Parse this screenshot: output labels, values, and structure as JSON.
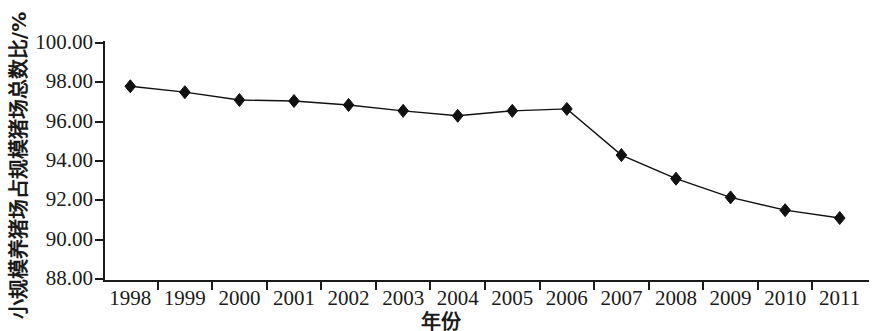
{
  "chart_data": {
    "type": "line",
    "title": "",
    "xlabel": "年份",
    "ylabel": "小规模养猪场占规模猪场总数比/%",
    "categories": [
      "1998",
      "1999",
      "2000",
      "2001",
      "2002",
      "2003",
      "2004",
      "2005",
      "2006",
      "2007",
      "2008",
      "2009",
      "2010",
      "2011"
    ],
    "values": [
      97.8,
      97.5,
      97.1,
      97.05,
      96.85,
      96.55,
      96.3,
      96.55,
      96.65,
      94.3,
      93.1,
      92.15,
      91.5,
      91.1
    ],
    "series": [
      {
        "name": "小规模养猪场占规模猪场总数比",
        "values": [
          97.8,
          97.5,
          97.1,
          97.05,
          96.85,
          96.55,
          96.3,
          96.55,
          96.65,
          94.3,
          93.1,
          92.15,
          91.5,
          91.1
        ],
        "color": "#111111",
        "marker": "diamond",
        "line_style": "solid"
      }
    ],
    "ylim": [
      88.0,
      100.0
    ],
    "ytick_step": 2.0,
    "ytick_labels": [
      "100.00",
      "98.00",
      "96.00",
      "94.00",
      "92.00",
      "90.00",
      "88.00"
    ],
    "ytick_values": [
      100.0,
      98.0,
      96.0,
      94.0,
      92.0,
      90.0,
      88.0
    ],
    "grid": false,
    "legend": "none",
    "background_color": "#ffffff",
    "axis_color": "#1a1a1a"
  }
}
